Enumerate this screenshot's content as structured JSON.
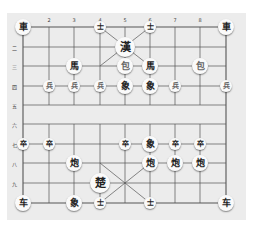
{
  "board": {
    "type": "xiangqi",
    "background": "#ececec",
    "line_color": "#555555",
    "columns_x": [
      23,
      49,
      74,
      100,
      125,
      150,
      175,
      200,
      226
    ],
    "rows_y": [
      27,
      47,
      66,
      86,
      105,
      124,
      144,
      163,
      183,
      203
    ],
    "column_labels": [
      "",
      "2",
      "3",
      "4",
      "5",
      "6",
      "7",
      "8",
      ""
    ],
    "row_labels": [
      "",
      "二",
      "三",
      "四",
      "五",
      "六",
      "七",
      "八",
      "九",
      ""
    ]
  },
  "pieces": [
    {
      "label": "車",
      "col": 1,
      "row": 1,
      "size": "normal",
      "tone": "dark"
    },
    {
      "label": "士",
      "col": 4,
      "row": 1,
      "size": "small",
      "tone": "dark"
    },
    {
      "label": "士",
      "col": 6,
      "row": 1,
      "size": "small",
      "tone": "dark"
    },
    {
      "label": "車",
      "col": 9,
      "row": 1,
      "size": "normal",
      "tone": "dark"
    },
    {
      "label": "漢",
      "col": 5,
      "row": 2,
      "size": "large",
      "tone": "dark"
    },
    {
      "label": "馬",
      "col": 3,
      "row": 3,
      "size": "normal",
      "tone": "dark"
    },
    {
      "label": "包",
      "col": 5,
      "row": 3,
      "size": "normal",
      "tone": "light"
    },
    {
      "label": "馬",
      "col": 6,
      "row": 3,
      "size": "normal",
      "tone": "dark"
    },
    {
      "label": "包",
      "col": 8,
      "row": 3,
      "size": "normal",
      "tone": "light"
    },
    {
      "label": "兵",
      "col": 2,
      "row": 4,
      "size": "small",
      "tone": "light"
    },
    {
      "label": "兵",
      "col": 3,
      "row": 4,
      "size": "small",
      "tone": "light"
    },
    {
      "label": "兵",
      "col": 4,
      "row": 4,
      "size": "small",
      "tone": "light"
    },
    {
      "label": "象",
      "col": 5,
      "row": 4,
      "size": "normal",
      "tone": "dark"
    },
    {
      "label": "象",
      "col": 6,
      "row": 4,
      "size": "normal",
      "tone": "dark"
    },
    {
      "label": "兵",
      "col": 7,
      "row": 4,
      "size": "small",
      "tone": "light"
    },
    {
      "label": "兵",
      "col": 9,
      "row": 4,
      "size": "small",
      "tone": "light"
    },
    {
      "label": "卒",
      "col": 1,
      "row": 7,
      "size": "small",
      "tone": "dark"
    },
    {
      "label": "卒",
      "col": 2,
      "row": 7,
      "size": "small",
      "tone": "dark"
    },
    {
      "label": "卒",
      "col": 5,
      "row": 7,
      "size": "small",
      "tone": "dark"
    },
    {
      "label": "象",
      "col": 6,
      "row": 7,
      "size": "normal",
      "tone": "dark"
    },
    {
      "label": "卒",
      "col": 7,
      "row": 7,
      "size": "small",
      "tone": "dark"
    },
    {
      "label": "卒",
      "col": 8,
      "row": 7,
      "size": "small",
      "tone": "dark"
    },
    {
      "label": "炮",
      "col": 3,
      "row": 8,
      "size": "normal",
      "tone": "dark"
    },
    {
      "label": "炮",
      "col": 6,
      "row": 8,
      "size": "normal",
      "tone": "dark"
    },
    {
      "label": "炮",
      "col": 7,
      "row": 8,
      "size": "normal",
      "tone": "dark"
    },
    {
      "label": "炮",
      "col": 8,
      "row": 8,
      "size": "normal",
      "tone": "dark"
    },
    {
      "label": "楚",
      "col": 4,
      "row": 9,
      "size": "large",
      "tone": "dark"
    },
    {
      "label": "车",
      "col": 1,
      "row": 10,
      "size": "normal",
      "tone": "dark"
    },
    {
      "label": "象",
      "col": 3,
      "row": 10,
      "size": "normal",
      "tone": "dark"
    },
    {
      "label": "士",
      "col": 4,
      "row": 10,
      "size": "small",
      "tone": "dark"
    },
    {
      "label": "士",
      "col": 6,
      "row": 10,
      "size": "small",
      "tone": "dark"
    },
    {
      "label": "车",
      "col": 9,
      "row": 10,
      "size": "normal",
      "tone": "dark"
    }
  ]
}
